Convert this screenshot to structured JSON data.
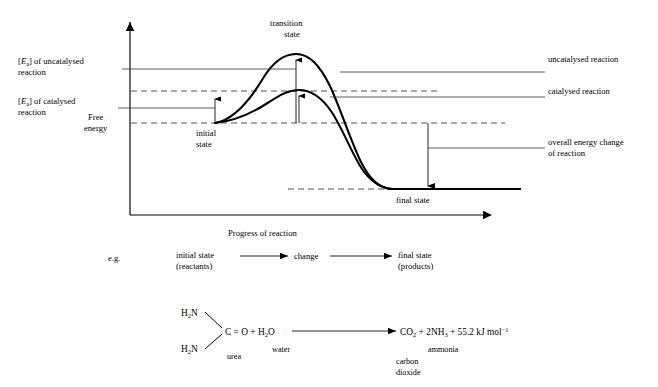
{
  "figure": {
    "axis": {
      "y_label_line1": "Free",
      "y_label_line2": "energy",
      "x_label": "Progress of reaction"
    },
    "left_labels": {
      "ea_uncatalysed_bracket_open": "[",
      "ea_uncatalysed_E": "E",
      "ea_uncatalysed_a": "a",
      "ea_uncatalysed_rest": "] of uncatalysed",
      "ea_uncatalysed_line2": "reaction",
      "ea_catalysed_bracket_open": "[",
      "ea_catalysed_E": "E",
      "ea_catalysed_a": "a",
      "ea_catalysed_rest": "] of catalysed",
      "ea_catalysed_line2": "reaction"
    },
    "curve_labels": {
      "transition_state_line1": "transition",
      "transition_state_line2": "state",
      "initial_state_line1": "initial",
      "initial_state_line2": "state",
      "final_state": "final state"
    },
    "right_labels": {
      "uncatalysed": "uncatalysed reaction",
      "catalysed": "catalysed reaction",
      "overall_line1": "overall energy change",
      "overall_line2": "of reaction"
    }
  },
  "example_row": {
    "prefix": "e.g.",
    "initial_line1": "initial state",
    "initial_line2": "(reactants)",
    "change": "change",
    "final_line1": "final state",
    "final_line2": "(products)"
  },
  "equation": {
    "urea_group_top_H": "H",
    "urea_group_top_sub": "2",
    "urea_group_top_N": "N",
    "urea_group_bottom_H": "H",
    "urea_group_bottom_sub": "2",
    "urea_group_bottom_N": "N",
    "urea_label": "urea",
    "carbonyl": "C = O + H",
    "carbonyl_sub": "2",
    "carbonyl_end": "O",
    "water_label": "water",
    "products_co2": "CO",
    "products_co2_sub": "2",
    "products_plus1": " + 2NH",
    "products_nh3_sub": "3",
    "products_plus2": " + 55.2 kJ mol",
    "products_sup": "−1",
    "ammonia_label": "ammonia",
    "carbon_dioxide_line1": "carbon",
    "carbon_dioxide_line2": "dioxide"
  },
  "colors": {
    "ink": "#000000",
    "dashed": "#555555",
    "leader": "#333333"
  }
}
